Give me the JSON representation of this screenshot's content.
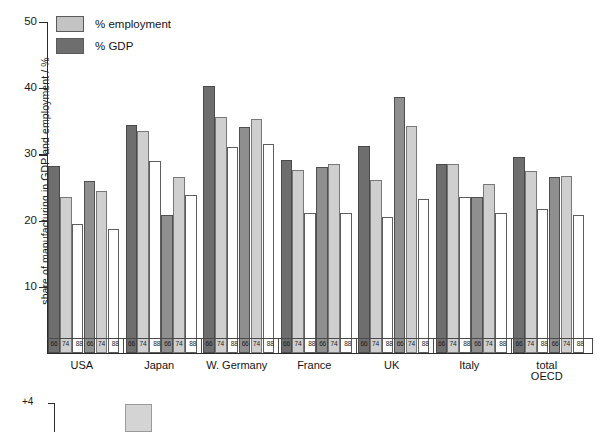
{
  "chart_data": {
    "type": "bar",
    "title": "",
    "xlabel": "",
    "ylabel": "share of manufacturing in GDP and employment / %",
    "ylim": [
      0,
      50
    ],
    "yticks": [
      10,
      20,
      30,
      40,
      50
    ],
    "ytick_labels": [
      "10",
      "20",
      "30",
      "40",
      "50"
    ],
    "grid": false,
    "legend_position": "top-left",
    "categories": [
      "USA",
      "Japan",
      "W. Germany",
      "France",
      "UK",
      "Italy",
      "total\nOECD"
    ],
    "year_labels": [
      "66",
      "74",
      "88"
    ],
    "legend": [
      "% employment",
      "% GDP"
    ],
    "series": [
      {
        "name": "% GDP",
        "year": "66",
        "values": [
          28.2,
          34.5,
          40.3,
          29.2,
          31.3,
          28.6,
          29.6
        ]
      },
      {
        "name": "% employment",
        "year": "66",
        "values": [
          26.0,
          20.8,
          34.1,
          28.1,
          38.6,
          23.6,
          26.6
        ]
      },
      {
        "name": "% GDP",
        "year": "74",
        "values": [
          23.5,
          33.5,
          35.6,
          27.6,
          26.1,
          28.5,
          27.5
        ]
      },
      {
        "name": "% employment",
        "year": "74",
        "values": [
          24.5,
          26.6,
          35.3,
          28.6,
          34.3,
          25.6,
          26.7
        ]
      },
      {
        "name": "% GDP",
        "year": "88",
        "values": [
          19.5,
          29.0,
          31.1,
          21.1,
          20.5,
          23.5,
          21.8
        ]
      },
      {
        "name": "% employment",
        "year": "88",
        "values": [
          18.7,
          23.8,
          31.5,
          21.2,
          23.2,
          21.1,
          20.8
        ]
      }
    ]
  },
  "axis": {
    "y_title": "share of manufacturing in GDP and employment / %",
    "ticks": [
      {
        "label": "50",
        "value": 50
      },
      {
        "label": "40",
        "value": 40
      },
      {
        "label": "30",
        "value": 30
      },
      {
        "label": "20",
        "value": 20
      },
      {
        "label": "10",
        "value": 10
      }
    ]
  },
  "legend": {
    "items": [
      {
        "label": "% employment",
        "key": "emp"
      },
      {
        "label": "% GDP",
        "key": "gdp"
      }
    ]
  },
  "groups": [
    {
      "name": "USA",
      "years": [
        "66",
        "74",
        "88"
      ]
    },
    {
      "name": "Japan",
      "years": [
        "66",
        "74",
        "88"
      ]
    },
    {
      "name": "W. Germany",
      "years": [
        "66",
        "74",
        "88"
      ]
    },
    {
      "name": "France",
      "years": [
        "66",
        "74",
        "88"
      ]
    },
    {
      "name": "UK",
      "years": [
        "66",
        "74",
        "88"
      ]
    },
    {
      "name": "Italy",
      "years": [
        "66",
        "74",
        "88"
      ]
    },
    {
      "name": "total OECD",
      "years": [
        "66",
        "74",
        "88"
      ]
    }
  ],
  "bottom_panel": {
    "axis_label": "+4"
  },
  "colors": {
    "gdp_66": "#6e6e6e",
    "gdp_74": "#8f8f8f",
    "gdp_88": "#ffffff",
    "emp_66": "#a8a8a8",
    "emp_74": "#cfcfcf",
    "emp_88": "#ffffff",
    "axis": "#2b2b2b",
    "text": "#141414"
  }
}
